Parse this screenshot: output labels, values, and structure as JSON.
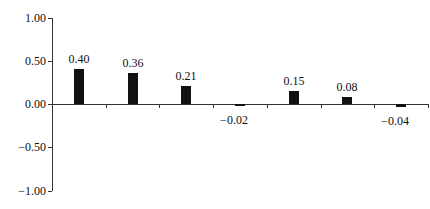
{
  "chart_data": {
    "type": "bar",
    "title": "",
    "xlabel": "",
    "ylabel": "",
    "categories": [
      "1",
      "2",
      "3",
      "4",
      "5",
      "6",
      "7"
    ],
    "values": [
      0.4,
      0.36,
      0.21,
      -0.02,
      0.15,
      0.08,
      -0.04
    ],
    "value_labels": [
      "0.40",
      "0.36",
      "0.21",
      "−0.02",
      "0.15",
      "0.08",
      "−0.04"
    ],
    "ylim": [
      -1.0,
      1.0
    ],
    "yticks": [
      1.0,
      0.5,
      0.0,
      -0.5,
      -1.0
    ],
    "ytick_labels": [
      "1.00",
      "0.50",
      "0.00",
      "−0.50",
      "−1.00"
    ],
    "grid": false,
    "legend": null,
    "bar_color": "#111111"
  }
}
